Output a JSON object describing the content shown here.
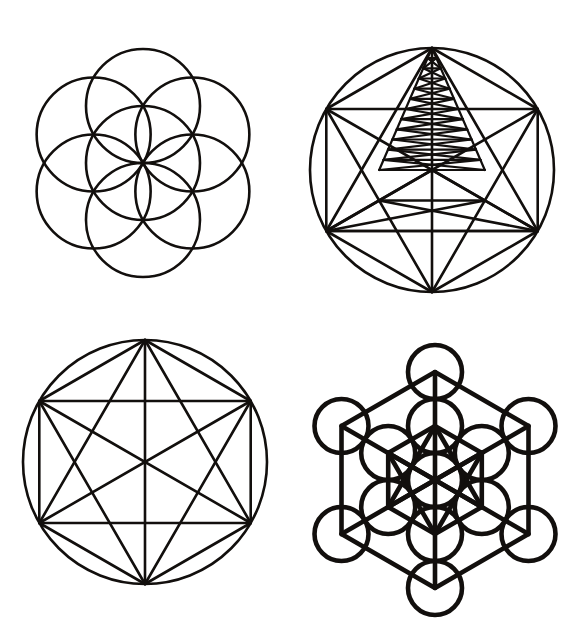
{
  "canvas": {
    "width": 579,
    "height": 641,
    "background": "#ffffff",
    "ink_color": "#120f0d",
    "title": "Sacred Geometry Figures"
  },
  "figures": [
    {
      "id": "seed-of-life",
      "name": "Seed of Life",
      "position": "top-left",
      "circle_count": 7,
      "center": {
        "x": 143,
        "y": 163
      },
      "radius": 57,
      "stroke_width": 2.6,
      "description": "Central circle surrounded by six circles of equal radius whose centers lie on the central circle"
    },
    {
      "id": "pyramid-hexagram",
      "name": "Pyramid Hexagram in Circle",
      "position": "top-right",
      "center": {
        "x": 432,
        "y": 170
      },
      "radius": 122,
      "vertex_count": 6,
      "nested_triangle_levels": 12,
      "stroke_width": 2.6,
      "description": "Inscribed hexagon with full chord set plus a narrow apex triangle subdivided by horizontal rungs and zigzag bracing"
    },
    {
      "id": "hexagram-circle",
      "name": "Hexagram in Circle",
      "position": "bottom-left",
      "center": {
        "x": 145,
        "y": 462
      },
      "radius": 122,
      "vertex_count": 6,
      "chord_count": 15,
      "stroke_width": 2.6,
      "description": "Six points on a circle joined by every possible chord, forming a hexagon, rectangle and two overlaid triangles"
    },
    {
      "id": "metatrons-cube",
      "name": "Metatron's Cube",
      "position": "bottom-right",
      "circle_count": 13,
      "center": {
        "x": 435,
        "y": 480
      },
      "circle_radius": 27,
      "ring_spacing": 54,
      "stroke_width": 4.6,
      "description": "Thirteen circles of the Fruit of Life with their centers joined by straight lines"
    }
  ],
  "chart_data": {
    "type": "diagram",
    "layout": "2x2 grid",
    "panels": [
      {
        "row": 1,
        "col": 1,
        "label": "Seed of Life"
      },
      {
        "row": 1,
        "col": 2,
        "label": "Pyramid Hexagram in Circle"
      },
      {
        "row": 2,
        "col": 1,
        "label": "Hexagram in Circle"
      },
      {
        "row": 2,
        "col": 2,
        "label": "Metatron's Cube"
      }
    ]
  }
}
